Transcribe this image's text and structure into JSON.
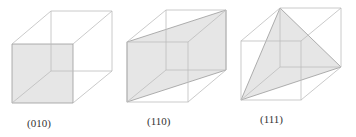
{
  "figures": [
    {
      "id": "plane-010",
      "label": "(010)",
      "plane": "face"
    },
    {
      "id": "plane-110",
      "label": "(110)",
      "plane": "diagonal"
    },
    {
      "id": "plane-111",
      "label": "(111)",
      "plane": "triangle"
    }
  ],
  "colors": {
    "edge": "#b8b8b8",
    "fill": "#e6e6e6",
    "plane_edge": "#9a9a9a"
  }
}
